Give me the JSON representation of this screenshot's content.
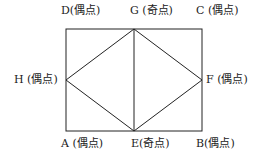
{
  "diagram": {
    "type": "graph",
    "vertices": [
      {
        "id": "A",
        "label": "A (偶点)",
        "x": 66,
        "y": 131
      },
      {
        "id": "B",
        "label": "B(偶点)",
        "x": 202,
        "y": 131
      },
      {
        "id": "C",
        "label": "C (偶点)",
        "x": 202,
        "y": 29
      },
      {
        "id": "D",
        "label": "D(偶点)",
        "x": 66,
        "y": 29
      },
      {
        "id": "E",
        "label": "E(奇点)",
        "x": 134,
        "y": 131
      },
      {
        "id": "F",
        "label": "F (偶点)",
        "x": 202,
        "y": 80
      },
      {
        "id": "G",
        "label": "G (奇点)",
        "x": 134,
        "y": 29
      },
      {
        "id": "H",
        "label": "H (偶点)",
        "x": 66,
        "y": 80
      }
    ],
    "edges": [
      [
        "D",
        "G"
      ],
      [
        "G",
        "C"
      ],
      [
        "C",
        "F"
      ],
      [
        "F",
        "B"
      ],
      [
        "B",
        "E"
      ],
      [
        "E",
        "A"
      ],
      [
        "A",
        "H"
      ],
      [
        "H",
        "D"
      ],
      [
        "H",
        "G"
      ],
      [
        "G",
        "F"
      ],
      [
        "F",
        "E"
      ],
      [
        "E",
        "H"
      ],
      [
        "G",
        "E"
      ]
    ],
    "line_color": "#222222"
  }
}
